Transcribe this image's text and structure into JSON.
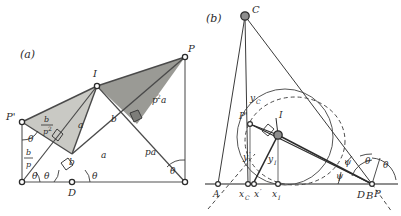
{
  "figure": {
    "background": "#ffffff",
    "ink": "#2b2b2b",
    "line_color": "#555555",
    "fill_light": "#c9c9c4",
    "fill_dark": "#9a9a95",
    "panels": [
      {
        "id": "a",
        "caption": "(a)",
        "points": [
          {
            "name": "P-prime",
            "label": "P'",
            "marker": "open-circle"
          },
          {
            "name": "I",
            "label": "I",
            "marker": "open-circle"
          },
          {
            "name": "P",
            "label": "P",
            "marker": "open-circle"
          },
          {
            "name": "D",
            "label": "D",
            "marker": "open-circle"
          },
          {
            "name": "left-foot",
            "label": "",
            "marker": "open-circle"
          },
          {
            "name": "right-foot",
            "label": "",
            "marker": "open-circle"
          }
        ],
        "segment_labels": [
          {
            "name": "b-over-p-squared",
            "num": "b",
            "den": "p",
            "den_exp": "2",
            "kind": "fraction"
          },
          {
            "name": "b-over-p",
            "num": "b",
            "den": "p",
            "den_exp": "",
            "kind": "fraction"
          },
          {
            "name": "a-upper",
            "text": "a",
            "kind": "plain"
          },
          {
            "name": "b-upper",
            "text": "b",
            "kind": "plain"
          },
          {
            "name": "b-lower",
            "text": "b",
            "kind": "plain"
          },
          {
            "name": "a-lower",
            "text": "a",
            "kind": "plain"
          },
          {
            "name": "p-squared-a",
            "base": "p",
            "exp": "2",
            "tail": "a",
            "kind": "power"
          },
          {
            "name": "p-a",
            "text": "pa",
            "kind": "plain"
          }
        ],
        "angle_labels": [
          {
            "name": "theta-at-P-prime",
            "text": "θ"
          },
          {
            "name": "theta-at-left-foot",
            "text": "θ"
          },
          {
            "name": "theta-at-D-left",
            "text": "θ"
          },
          {
            "name": "theta-at-D-right",
            "text": "θ"
          },
          {
            "name": "theta-at-P",
            "text": "θ"
          }
        ]
      },
      {
        "id": "b",
        "caption": "(b)",
        "points": [
          {
            "name": "C",
            "label": "C",
            "marker": "filled-circle"
          },
          {
            "name": "I",
            "label": "I",
            "marker": "filled-circle"
          },
          {
            "name": "P-prime",
            "label": "P'",
            "marker": "open-circle"
          },
          {
            "name": "A",
            "label": "A",
            "marker": "open-circle"
          },
          {
            "name": "x-C",
            "label": "x_C",
            "marker": "open-circle"
          },
          {
            "name": "x-prime",
            "label": "x'",
            "marker": "open-circle"
          },
          {
            "name": "x-I",
            "label": "x_I",
            "marker": "open-circle"
          },
          {
            "name": "D",
            "label": "D",
            "marker": "open-circle"
          },
          {
            "name": "B",
            "label": "B",
            "marker": "open-circle"
          },
          {
            "name": "P",
            "label": "P",
            "marker": "open-circle"
          }
        ],
        "axis_labels": [
          {
            "name": "label-A",
            "base": "A",
            "sub": ""
          },
          {
            "name": "label-xC",
            "base": "x",
            "sub": "C"
          },
          {
            "name": "label-x-prime",
            "base": "x",
            "sub": "",
            "prime": true
          },
          {
            "name": "label-xI",
            "base": "x",
            "sub": "I"
          },
          {
            "name": "label-D",
            "base": "D",
            "sub": ""
          },
          {
            "name": "label-B",
            "base": "B",
            "sub": ""
          },
          {
            "name": "label-P",
            "base": "P",
            "sub": ""
          }
        ],
        "height_labels": [
          {
            "name": "y-C",
            "base": "y",
            "sub": "C"
          },
          {
            "name": "y-prime",
            "base": "y",
            "sub": "",
            "prime": true
          },
          {
            "name": "y-I",
            "base": "y",
            "sub": "I"
          }
        ],
        "angle_labels": [
          {
            "name": "psi-lower",
            "text": "ψ"
          },
          {
            "name": "psi-upper",
            "text": "ψ"
          },
          {
            "name": "theta-inner",
            "text": "θ"
          },
          {
            "name": "theta-outer",
            "text": "θ"
          }
        ],
        "curves": [
          {
            "name": "solid-circle",
            "style": "solid"
          },
          {
            "name": "dashed-ellipse",
            "style": "dashed"
          },
          {
            "name": "dashed-ray-left",
            "style": "dashed"
          },
          {
            "name": "dashed-ray-right",
            "style": "dashed"
          }
        ]
      }
    ]
  }
}
